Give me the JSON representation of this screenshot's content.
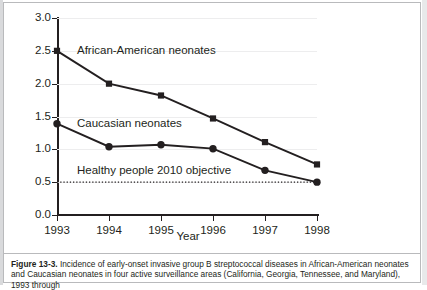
{
  "figure": {
    "label": "Figure 13-3.",
    "caption": "Incidence of early-onset invasive group B streptococcal diseases in African-American neonates and Caucasian neonates in four active surveillance areas (California, Georgia, Tennessee, and Maryland), 1993 through"
  },
  "colors": {
    "ink": "#231f20",
    "gridline": "#ededee",
    "frame": "#b9babc",
    "background": "#ffffff"
  },
  "chart_data": {
    "type": "line",
    "title": "",
    "xlabel": "Year",
    "ylabel": "Cases per 1000 live births",
    "categories": [
      "1993",
      "1994",
      "1995",
      "1996",
      "1997",
      "1998"
    ],
    "x": [
      1993,
      1994,
      1995,
      1996,
      1997,
      1998
    ],
    "xlim": [
      1993,
      1998
    ],
    "ylim": [
      0.0,
      3.0
    ],
    "yticks": [
      "0.0",
      "0.5",
      "1.0",
      "1.5",
      "2.0",
      "2.5",
      "3.0"
    ],
    "ytick_values": [
      0.0,
      0.5,
      1.0,
      1.5,
      2.0,
      2.5,
      3.0
    ],
    "grid": true,
    "legend_position": "inline-annotation",
    "series": [
      {
        "name": "African-American neonates",
        "marker": "square",
        "values": [
          2.5,
          2.0,
          1.82,
          1.47,
          1.11,
          0.77
        ]
      },
      {
        "name": "Caucasian neonates",
        "marker": "circle",
        "values": [
          1.39,
          1.04,
          1.07,
          1.01,
          0.68,
          0.5
        ]
      }
    ],
    "annotations": [
      {
        "text": "African-American neonates",
        "value": 2.5
      },
      {
        "text": "Caucasian neonates",
        "value": 1.39
      },
      {
        "text": "Healthy people 2010 objective",
        "value": 0.5
      }
    ],
    "reference_line": {
      "label": "Healthy people 2010 objective",
      "value": 0.5,
      "style": "dotted"
    }
  }
}
